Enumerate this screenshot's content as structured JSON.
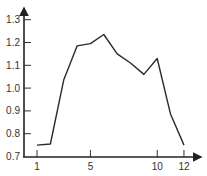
{
  "chart_data": {
    "type": "line",
    "title": "",
    "xlabel": "",
    "ylabel": "",
    "x": [
      1,
      2,
      3,
      4,
      5,
      6,
      7,
      8,
      9,
      10,
      11,
      12
    ],
    "series": [
      {
        "name": "series-1",
        "values": [
          0.75,
          0.755,
          1.035,
          1.185,
          1.195,
          1.235,
          1.15,
          1.11,
          1.06,
          1.13,
          0.885,
          0.75
        ]
      }
    ],
    "xticks": [
      1,
      5,
      10,
      12
    ],
    "xtick_labels": [
      "1",
      "5",
      "10",
      "12"
    ],
    "yticks": [
      0.7,
      0.8,
      0.9,
      1.0,
      1.1,
      1.2,
      1.3
    ],
    "ytick_labels": [
      "0.7",
      "0.8",
      "0.9",
      "1.0",
      "1.1",
      "1.2",
      "1.3"
    ],
    "xlim": [
      0,
      13
    ],
    "ylim": [
      0.7,
      1.35
    ],
    "grid": false,
    "legend": null,
    "colors": {
      "line": "#2a2a2a",
      "axis": "#222222",
      "text": "#333333"
    }
  }
}
